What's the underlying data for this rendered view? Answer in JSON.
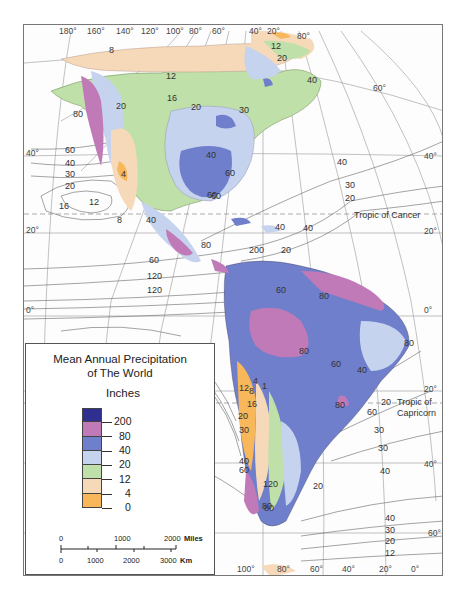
{
  "legend": {
    "title_line1": "Mean Annual Precipitation",
    "title_line2": "of The World",
    "units": "Inches",
    "classes": [
      {
        "color": "#2e2f8f",
        "label": "200"
      },
      {
        "color": "#c07ab8",
        "label": "80"
      },
      {
        "color": "#6f7fcc",
        "label": "40"
      },
      {
        "color": "#c6d3ef",
        "label": "20"
      },
      {
        "color": "#bfe0a8",
        "label": "12"
      },
      {
        "color": "#f6d9b8",
        "label": "4"
      },
      {
        "color": "#f7b75a",
        "label": "0"
      }
    ],
    "scale": {
      "miles_labels": [
        "0",
        "1000",
        "2000"
      ],
      "miles_unit": "Miles",
      "km_labels": [
        "0",
        "1000",
        "2000",
        "3000"
      ],
      "km_unit": "Km"
    }
  },
  "graticule": {
    "top_longitudes": [
      "180°",
      "160°",
      "140°",
      "120°",
      "100°",
      "80°",
      "60°",
      "40°",
      "20°"
    ],
    "bottom_longitudes": [
      "100°",
      "80°",
      "60°",
      "40°",
      "20°",
      "0°"
    ],
    "left_latitudes": [
      "40°",
      "20°",
      "0°"
    ],
    "right_latitudes": [
      "60°",
      "40°",
      "20°",
      "0°",
      "20°",
      "40°",
      "60°"
    ],
    "top_right_lat": "80°",
    "tropic_cancer": "Tropic of Cancer",
    "tropic_capricorn_line1": "Tropic of",
    "tropic_capricorn_line2": "Capricorn"
  },
  "isohyet_labels": {
    "pacific_north": [
      "60",
      "40",
      "30",
      "20",
      "16",
      "12",
      "8",
      "80"
    ],
    "pacific_equatorial": [
      "60",
      "120",
      "120"
    ],
    "north_america": [
      "8",
      "12",
      "16",
      "20",
      "20",
      "30",
      "40",
      "60",
      "40",
      "60",
      "4",
      "12",
      "20",
      "40"
    ],
    "atlantic_north": [
      "40",
      "30",
      "20",
      "40",
      "40"
    ],
    "central_america": [
      "200",
      "20",
      "80",
      "60"
    ],
    "south_america": [
      "60",
      "80",
      "80",
      "80",
      "60",
      "40",
      "80",
      "80"
    ],
    "pacific_south": [
      "4",
      "1",
      "12",
      "8",
      "16",
      "20",
      "30",
      "40",
      "60",
      "120",
      "80"
    ],
    "atlantic_south": [
      "20",
      "60",
      "30",
      "30",
      "40",
      "20",
      "40",
      "30",
      "20",
      "12"
    ]
  },
  "colors": {
    "ocean_line": "#777777",
    "dry_orange": "#f7b75a",
    "semi_arid": "#f6d9b8",
    "steppe_green": "#bfe0a8",
    "light_blue": "#c6d3ef",
    "mid_blue": "#6f7fcc",
    "wet_pink": "#c07ab8",
    "very_wet": "#2e2f8f"
  }
}
